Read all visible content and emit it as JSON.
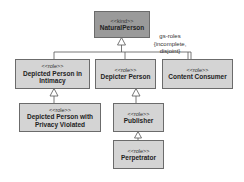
{
  "diagram": {
    "nodes": [
      {
        "id": "natural-person",
        "stereotype": "<<kind>>",
        "name": "NaturalPerson"
      },
      {
        "id": "depicted-intimacy",
        "stereotype": "<<role>>",
        "name": "Depicted Person in Intimacy"
      },
      {
        "id": "depicter",
        "stereotype": "<<role>>",
        "name": "Depicter Person"
      },
      {
        "id": "content-consumer",
        "stereotype": "<<role>>",
        "name": "Content Consumer"
      },
      {
        "id": "depicted-privacy",
        "stereotype": "<<role>>",
        "name": "Depicted Person with Privacy Violated"
      },
      {
        "id": "publisher",
        "stereotype": "<<role>>",
        "name": "Publisher"
      },
      {
        "id": "perpetrator",
        "stereotype": "<<role>>",
        "name": "Perpetrator"
      }
    ],
    "generalization_set": {
      "label_line1": "gs-roles",
      "label_line2": "{incomplete,",
      "label_line3": "disjoint}"
    },
    "edges": [
      {
        "from": "depicted-intimacy",
        "to": "natural-person",
        "type": "generalization"
      },
      {
        "from": "depicter",
        "to": "natural-person",
        "type": "generalization"
      },
      {
        "from": "content-consumer",
        "to": "natural-person",
        "type": "generalization"
      },
      {
        "from": "depicted-privacy",
        "to": "depicted-intimacy",
        "type": "generalization"
      },
      {
        "from": "publisher",
        "to": "depicter",
        "type": "generalization"
      },
      {
        "from": "perpetrator",
        "to": "publisher",
        "type": "generalization"
      }
    ],
    "colors": {
      "kind_fill": "#9a9a9a",
      "role_fill": "#d4d4d4",
      "border": "#6b6b6b"
    }
  }
}
